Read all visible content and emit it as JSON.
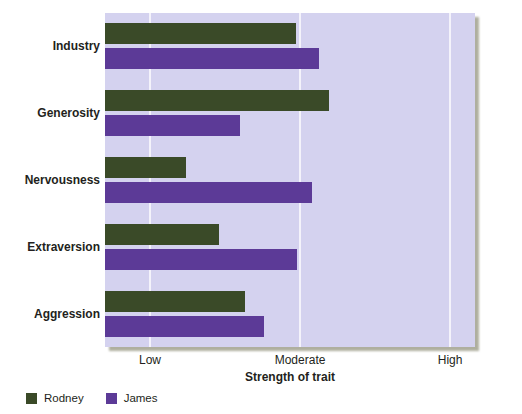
{
  "chart_data": {
    "type": "bar",
    "orientation": "horizontal",
    "title": "",
    "xlabel": "Strength of trait",
    "ylabel": "",
    "categories": [
      "Industry",
      "Generosity",
      "Nervousness",
      "Extraversion",
      "Aggression"
    ],
    "series": [
      {
        "name": "Rodney",
        "color": "#3a4a28",
        "values": [
          6.36,
          7.45,
          2.7,
          3.8,
          4.65
        ]
      },
      {
        "name": "James",
        "color": "#5c3a97",
        "values": [
          7.13,
          4.5,
          6.9,
          6.4,
          5.3
        ]
      }
    ],
    "xticks": [
      {
        "label": "Low",
        "value": 1.5
      },
      {
        "label": "Moderate",
        "value": 6.5
      },
      {
        "label": "High",
        "value": 11.5
      }
    ],
    "xlim": [
      0,
      12.33
    ],
    "grid": true,
    "legend_position": "bottom-left",
    "plot_background": "#d4d2ef",
    "gridline_color": "#f4f3fb"
  },
  "axis": {
    "x_title": "Strength of trait"
  },
  "legend": {
    "items": [
      {
        "label": "Rodney",
        "color": "#3a4a28"
      },
      {
        "label": "James",
        "color": "#5c3a97"
      }
    ]
  }
}
